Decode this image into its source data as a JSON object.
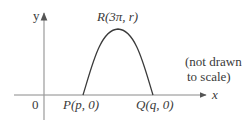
{
  "diagram": {
    "axes": {
      "x_label": "x",
      "y_label": "y",
      "origin_label": "0"
    },
    "points": {
      "peak": "R(3π, r)",
      "left_root": "P(p, 0)",
      "right_root": "Q(q, 0)"
    },
    "note": {
      "line1": "(not drawn",
      "line2": "to scale)"
    },
    "colors": {
      "axis": "#8a8a8a",
      "curve": "#3a3a3a",
      "text": "#3a3a3a"
    }
  }
}
